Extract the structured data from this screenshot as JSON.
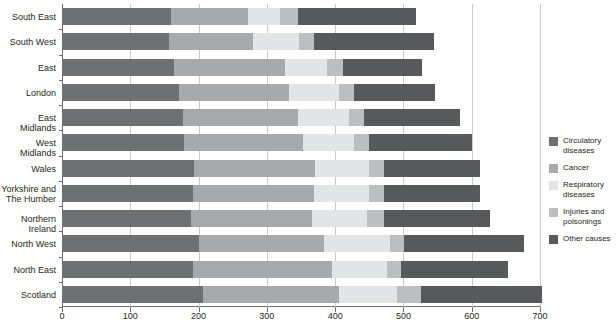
{
  "chart_data": {
    "type": "bar",
    "orientation": "horizontal",
    "stacked": true,
    "title": "",
    "xlabel": "",
    "ylabel": "",
    "xlim": [
      0,
      700
    ],
    "xticks": [
      0,
      100,
      200,
      300,
      400,
      500,
      600,
      700
    ],
    "grid": true,
    "legend_position": "right",
    "categories": [
      "South East",
      "South West",
      "East",
      "London",
      "East Midlands",
      "West Midlands",
      "Wales",
      "Yorkshire and\nThe Humber",
      "Northern Ireland",
      "North West",
      "North East",
      "Scotland"
    ],
    "series": [
      {
        "name": "Circulatory diseases",
        "color": "#6f7072",
        "values": [
          159,
          156,
          164,
          171,
          177,
          178,
          193,
          192,
          189,
          200,
          192,
          206
        ]
      },
      {
        "name": "Cancer",
        "color": "#a7a9ac",
        "values": [
          114,
          124,
          162,
          162,
          169,
          175,
          177,
          177,
          177,
          184,
          203,
          200
        ]
      },
      {
        "name": "Respiratory diseases",
        "color": "#e3e4e5",
        "values": [
          46,
          67,
          62,
          72,
          75,
          74,
          80,
          81,
          81,
          96,
          81,
          85
        ]
      },
      {
        "name": "Injuries and poisonings",
        "color": "#bcbec0",
        "values": [
          27,
          22,
          24,
          23,
          22,
          22,
          22,
          22,
          25,
          21,
          21,
          35
        ]
      },
      {
        "name": "Other causes",
        "color": "#58595b",
        "values": [
          172,
          176,
          115,
          118,
          140,
          152,
          140,
          140,
          155,
          175,
          156,
          177
        ]
      }
    ],
    "totals": [
      518,
      545,
      527,
      546,
      583,
      601,
      612,
      612,
      627,
      676,
      653,
      703
    ]
  },
  "legend": {
    "items": [
      {
        "label": "Circulatory\ndiseases",
        "color": "#6f7072"
      },
      {
        "label": "Cancer",
        "color": "#a7a9ac"
      },
      {
        "label": "Respiratory\ndiseases",
        "color": "#e3e4e5"
      },
      {
        "label": "Injuries and\npoisonings",
        "color": "#bcbec0"
      },
      {
        "label": "Other causes",
        "color": "#58595b"
      }
    ]
  },
  "axis": {
    "x_tick_labels": [
      "0",
      "100",
      "200",
      "300",
      "400",
      "500",
      "600",
      "700"
    ]
  }
}
